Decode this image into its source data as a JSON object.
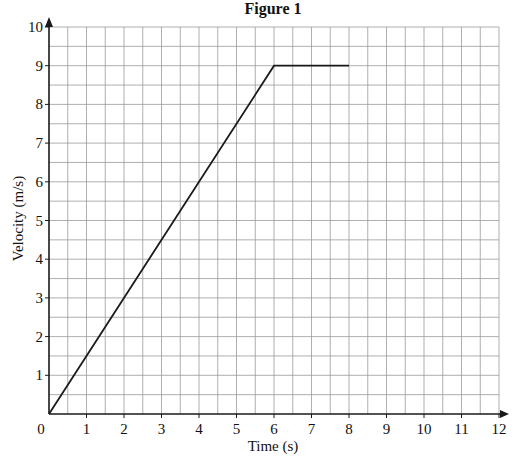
{
  "chart_data": {
    "type": "line",
    "title": "Figure 1",
    "xlabel": "Time (s)",
    "ylabel": "Velocity (m/s)",
    "xlim": [
      0,
      12
    ],
    "ylim": [
      0,
      10
    ],
    "x_ticks": [
      "0",
      "1",
      "2",
      "3",
      "4",
      "5",
      "6",
      "7",
      "8",
      "9",
      "10",
      "11",
      "12"
    ],
    "y_ticks": [
      "1",
      "2",
      "3",
      "4",
      "5",
      "6",
      "7",
      "8",
      "9",
      "10"
    ],
    "grid": true,
    "grid_minor_step": 0.5,
    "legend": null,
    "series": [
      {
        "name": "velocity",
        "x": [
          0,
          6,
          8
        ],
        "y": [
          0,
          9,
          9
        ]
      }
    ]
  },
  "colors": {
    "line": "#1a1a1a",
    "axis": "#1a1a1a",
    "grid": "#9a9a9a"
  }
}
